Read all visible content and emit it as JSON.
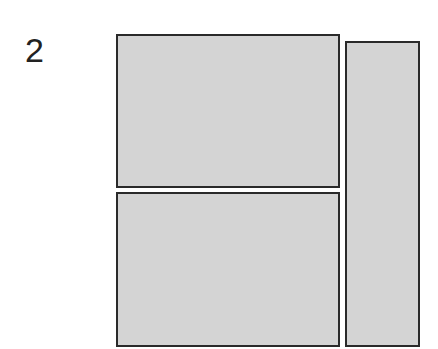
{
  "figure": {
    "label": "2",
    "panels": [
      {
        "id": "top-left",
        "x": 116,
        "y": 34,
        "w": 224,
        "h": 154
      },
      {
        "id": "bottom-left",
        "x": 116,
        "y": 192,
        "w": 224,
        "h": 155
      },
      {
        "id": "right",
        "x": 345,
        "y": 41,
        "w": 75,
        "h": 306
      }
    ],
    "colors": {
      "fill": "#d4d4d4",
      "stroke": "#2a2a2a"
    }
  }
}
